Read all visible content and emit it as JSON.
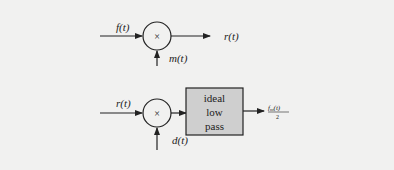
{
  "diagram": {
    "modulator": {
      "input_label": "f(t)",
      "multiplier_symbol": "×",
      "carrier_label": "m(t)",
      "output_label": "r(t)"
    },
    "demodulator": {
      "input_label": "r(t)",
      "multiplier_symbol": "×",
      "carrier_label": "d(t)",
      "filter_lines": [
        "ideal",
        "low",
        "pass"
      ],
      "output_numerator": "f",
      "output_subscript": "m",
      "output_arg": "(t)",
      "output_denominator": "2"
    },
    "colors": {
      "background": "#f1f1f0",
      "line": "#222222",
      "filter_fill": "#cfcfcf"
    }
  }
}
